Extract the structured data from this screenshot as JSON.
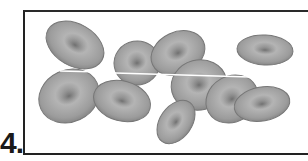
{
  "item": {
    "number_label": "4."
  },
  "figure": {
    "cell_count": 12,
    "colors": {
      "cell_fill": "#9a9a9a",
      "cell_edge": "#6e6e6e",
      "cell_center": "#7a7a7a",
      "frame_border": "#222222"
    }
  }
}
